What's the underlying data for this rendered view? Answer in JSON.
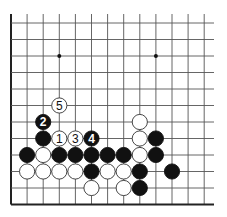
{
  "diagram": {
    "type": "go-board-fragment",
    "colors": {
      "background": "#ffffff",
      "line": "#555555",
      "edge": "#222222",
      "black": "#111111",
      "white": "#ffffff"
    },
    "grid": {
      "x0": 11,
      "dx": 16.1,
      "cols": 13,
      "x_end": 214,
      "y0": 23,
      "dy": 16.5,
      "rows": 12,
      "y_top": 14,
      "left_edge": true,
      "bottom_edge": true
    },
    "star_points": [
      {
        "col": 3,
        "row": 2
      },
      {
        "col": 9,
        "row": 2
      }
    ],
    "stones": [
      {
        "col": 3,
        "row": 5,
        "color": "white",
        "label": "5"
      },
      {
        "col": 2,
        "row": 6,
        "color": "black",
        "label": "2"
      },
      {
        "col": 8,
        "row": 6,
        "color": "white",
        "label": ""
      },
      {
        "col": 2,
        "row": 7,
        "color": "black",
        "label": ""
      },
      {
        "col": 3,
        "row": 7,
        "color": "white",
        "label": "1"
      },
      {
        "col": 4,
        "row": 7,
        "color": "white",
        "label": "3"
      },
      {
        "col": 5,
        "row": 7,
        "color": "black",
        "label": "4"
      },
      {
        "col": 8,
        "row": 7,
        "color": "white",
        "label": ""
      },
      {
        "col": 9,
        "row": 7,
        "color": "black",
        "label": ""
      },
      {
        "col": 1,
        "row": 8,
        "color": "black",
        "label": ""
      },
      {
        "col": 2,
        "row": 8,
        "color": "white",
        "label": ""
      },
      {
        "col": 3,
        "row": 8,
        "color": "black",
        "label": ""
      },
      {
        "col": 4,
        "row": 8,
        "color": "black",
        "label": ""
      },
      {
        "col": 5,
        "row": 8,
        "color": "black",
        "label": ""
      },
      {
        "col": 6,
        "row": 8,
        "color": "black",
        "label": ""
      },
      {
        "col": 7,
        "row": 8,
        "color": "black",
        "label": ""
      },
      {
        "col": 8,
        "row": 8,
        "color": "white",
        "label": ""
      },
      {
        "col": 9,
        "row": 8,
        "color": "black",
        "label": ""
      },
      {
        "col": 1,
        "row": 9,
        "color": "white",
        "label": ""
      },
      {
        "col": 2,
        "row": 9,
        "color": "white",
        "label": ""
      },
      {
        "col": 3,
        "row": 9,
        "color": "white",
        "label": ""
      },
      {
        "col": 4,
        "row": 9,
        "color": "white",
        "label": ""
      },
      {
        "col": 5,
        "row": 9,
        "color": "black",
        "label": ""
      },
      {
        "col": 6,
        "row": 9,
        "color": "white",
        "label": ""
      },
      {
        "col": 7,
        "row": 9,
        "color": "white",
        "label": ""
      },
      {
        "col": 8,
        "row": 9,
        "color": "black",
        "label": ""
      },
      {
        "col": 10,
        "row": 9,
        "color": "black",
        "label": ""
      },
      {
        "col": 5,
        "row": 10,
        "color": "white",
        "label": ""
      },
      {
        "col": 7,
        "row": 10,
        "color": "white",
        "label": ""
      },
      {
        "col": 8,
        "row": 10,
        "color": "black",
        "label": ""
      }
    ]
  }
}
